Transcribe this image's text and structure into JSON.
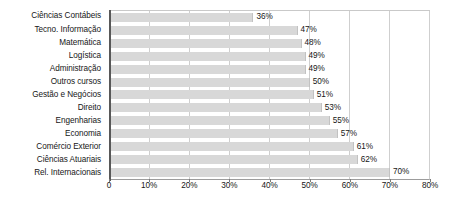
{
  "chart_data": {
    "type": "bar",
    "orientation": "horizontal",
    "title": "",
    "subtitle": "",
    "xlabel": "",
    "ylabel": "",
    "xlim": [
      0,
      80
    ],
    "grid": true,
    "legend": "none",
    "value_suffix": "%",
    "xticks": [
      "0",
      "10%",
      "20%",
      "30%",
      "40%",
      "50%",
      "60%",
      "70%",
      "80%"
    ],
    "xtick_values": [
      0,
      10,
      20,
      30,
      40,
      50,
      60,
      70,
      80
    ],
    "categories": [
      "Ciências Contábeis",
      "Tecno. Informação",
      "Matemática",
      "Logística",
      "Administração",
      "Outros cursos",
      "Gestão e Negócios",
      "Direito",
      "Engenharias",
      "Economia",
      "Comércio Exterior",
      "Ciências Atuariais",
      "Rel. Internacionais"
    ],
    "values": [
      36,
      47,
      48,
      49,
      49,
      50,
      51,
      53,
      55,
      57,
      61,
      62,
      70
    ],
    "data_labels": [
      "36%",
      "47%",
      "48%",
      "49%",
      "49%",
      "50%",
      "51%",
      "53%",
      "55%",
      "57%",
      "61%",
      "62%",
      "70%"
    ],
    "colors": {
      "bar_fill": "#d8d8d8",
      "bar_edge": "#c2c2c2",
      "gridline": "#cfcfcf",
      "axis": "#585858",
      "plot_border": "#c9c9c9",
      "text": "#161616",
      "background": "#ffffff"
    }
  }
}
